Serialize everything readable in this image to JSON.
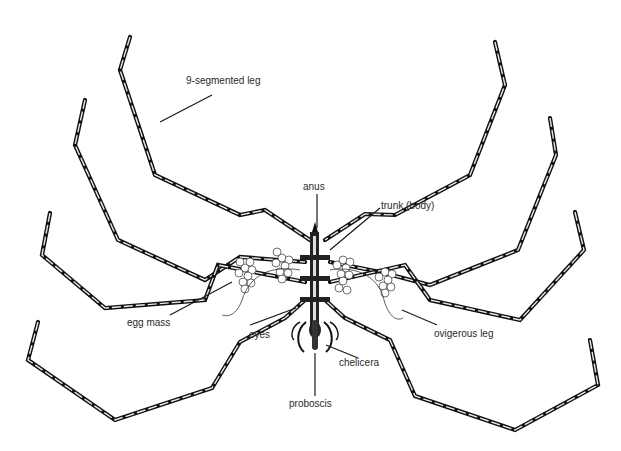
{
  "diagram": {
    "colors": {
      "background": "#ffffff",
      "ink": "#111111",
      "label_text": "#2a2a2a"
    },
    "labels": [
      {
        "id": "leg",
        "text": "9-segmented leg",
        "x": 186,
        "y": 81
      },
      {
        "id": "anus",
        "text": "anus",
        "x": 306,
        "y": 181
      },
      {
        "id": "trunk",
        "text": "trunk (body)",
        "x": 381,
        "y": 201
      },
      {
        "id": "egg_mass",
        "text": "egg mass",
        "x": 127,
        "y": 317
      },
      {
        "id": "eyes",
        "text": "eyes",
        "x": 249,
        "y": 330
      },
      {
        "id": "ovigerous_leg",
        "text": "ovigerous leg",
        "x": 434,
        "y": 330
      },
      {
        "id": "chelicera",
        "text": "chelicera",
        "x": 339,
        "y": 358
      },
      {
        "id": "proboscis",
        "text": "proboscis",
        "x": 289,
        "y": 399
      }
    ]
  }
}
